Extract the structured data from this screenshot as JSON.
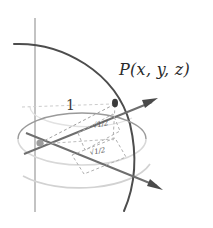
{
  "figure": {
    "background_color": "#ffffff"
  },
  "labels": {
    "point": "P(x, y, z)",
    "radius": "1",
    "coord_vertical": "√1/2",
    "coord_horizontal": "√1/2"
  },
  "colors": {
    "sphere_arc": "#4a4a4a",
    "axis": "#6e6e6e",
    "axis_light": "#b9b9b9",
    "equator_front": "#8f8f8f",
    "equator_back": "#d2d2d2",
    "dashed": "#a8a8a8",
    "point_dot": "#3a3a3a",
    "origin_dot": "#9a9a9a",
    "text": "#2b2b2b"
  },
  "geometry": {
    "origin": {
      "x": 40,
      "y": 143
    },
    "point_p": {
      "x": 115,
      "y": 103
    },
    "x_axis_arrow_tip": {
      "x": 163,
      "y": 190
    },
    "y_axis_arrow_tip": {
      "x": 158,
      "y": 98
    },
    "z_axis_top": {
      "x": 35,
      "y": 18
    },
    "z_axis_bottom": {
      "x": 35,
      "y": 212
    },
    "sphere_radius": 116
  }
}
